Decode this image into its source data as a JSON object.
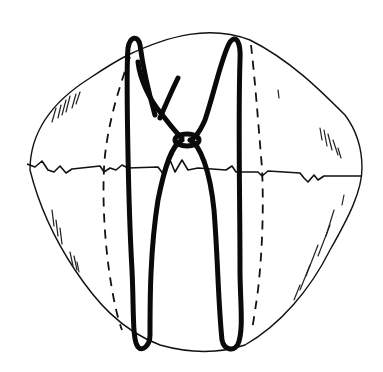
{
  "figure": {
    "colors": {
      "background": "#ffffff",
      "ink": "#111111"
    },
    "elements": [
      "sphere-outline",
      "equator-line",
      "left-dashed-meridian",
      "right-dashed-meridian",
      "knotted-loop",
      "shading-hatches"
    ]
  }
}
